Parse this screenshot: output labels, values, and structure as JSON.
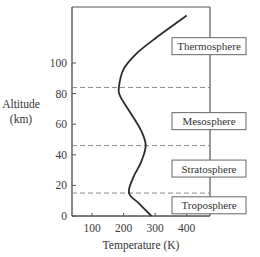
{
  "chart_data": {
    "type": "line",
    "title": "",
    "xlabel": "Temperature (K)",
    "ylabel": "Altitude (km)",
    "ylabel_lines": [
      "Altitude",
      "(km)"
    ],
    "xlim": [
      40,
      460
    ],
    "ylim": [
      0,
      130
    ],
    "x_ticks": [
      100,
      200,
      300,
      400
    ],
    "y_ticks": [
      0,
      20,
      40,
      60,
      80,
      100
    ],
    "x_tick_labels": [
      "100",
      "200",
      "300",
      "400"
    ],
    "y_tick_labels": [
      "0",
      "20",
      "40",
      "60",
      "80",
      "100"
    ],
    "grid": false,
    "series": [
      {
        "name": "Temperature profile",
        "points": [
          {
            "x": 288,
            "y": 0
          },
          {
            "x": 250,
            "y": 8
          },
          {
            "x": 217,
            "y": 15
          },
          {
            "x": 230,
            "y": 25
          },
          {
            "x": 255,
            "y": 35
          },
          {
            "x": 270,
            "y": 46
          },
          {
            "x": 255,
            "y": 56
          },
          {
            "x": 220,
            "y": 68
          },
          {
            "x": 190,
            "y": 78
          },
          {
            "x": 185,
            "y": 84
          },
          {
            "x": 200,
            "y": 96
          },
          {
            "x": 240,
            "y": 106
          },
          {
            "x": 300,
            "y": 116
          },
          {
            "x": 400,
            "y": 131
          }
        ]
      }
    ],
    "boundaries_km": [
      15,
      46,
      84
    ],
    "layers": [
      {
        "name": "Thermosphere",
        "label_altitude": 111
      },
      {
        "name": "Mesosphere",
        "label_altitude": 62
      },
      {
        "name": "Stratosphere",
        "label_altitude": 31
      },
      {
        "name": "Troposphere",
        "label_altitude": 7
      }
    ],
    "colors": {
      "curve": "#2b2b2b",
      "axes": "#555555",
      "dashed": "#8a8a8a",
      "label_box": "#666666"
    }
  }
}
